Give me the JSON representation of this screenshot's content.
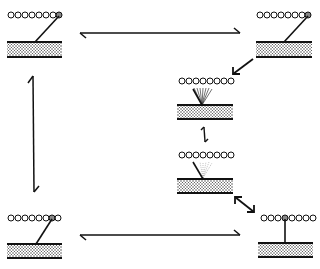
{
  "diagram": {
    "type": "cycle",
    "colors": {
      "ink": "#111111",
      "background": "#ffffff",
      "bead_marked": "#888888"
    },
    "states": [
      {
        "id": "top-left",
        "label": "",
        "lever": "tilted-right",
        "marked_bead_index": 7
      },
      {
        "id": "top-right",
        "label": "",
        "lever": "tilted-right",
        "marked_bead_index": 7
      },
      {
        "id": "mid-right-upper",
        "label": "",
        "lever": "fan-spread",
        "marked_bead_index": null
      },
      {
        "id": "mid-right-lower",
        "label": "",
        "lever": "fan-faint",
        "marked_bead_index": null
      },
      {
        "id": "bottom-right",
        "label": "",
        "lever": "vertical",
        "marked_bead_index": 4
      },
      {
        "id": "bottom-left",
        "label": "",
        "lever": "tilted-right",
        "marked_bead_index": 6
      }
    ],
    "transitions": [
      {
        "from": "top-left",
        "to": "top-right",
        "style": "double-harpoon"
      },
      {
        "from": "top-right",
        "to": "mid-right-upper",
        "style": "arrow"
      },
      {
        "from": "mid-right-upper",
        "to": "mid-right-lower",
        "style": "double-harpoon"
      },
      {
        "from": "mid-right-lower",
        "to": "bottom-right",
        "style": "double-arrow"
      },
      {
        "from": "bottom-right",
        "to": "bottom-left",
        "style": "double-harpoon"
      },
      {
        "from": "bottom-left",
        "to": "top-left",
        "style": "double-harpoon"
      }
    ]
  }
}
